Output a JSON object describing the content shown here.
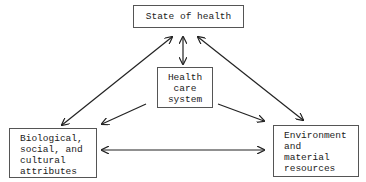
{
  "nodes": {
    "state": {
      "lines": [
        "State of health"
      ]
    },
    "care": {
      "lines": [
        "Health",
        "care",
        "system"
      ]
    },
    "bio": {
      "lines": [
        "Biological,",
        "social, and",
        "cultural",
        "attributes"
      ]
    },
    "env": {
      "lines": [
        "Environment",
        "and",
        "material",
        "resources"
      ]
    }
  },
  "edges": [
    {
      "from": "bio",
      "to": "state",
      "type": "bidirectional"
    },
    {
      "from": "env",
      "to": "state",
      "type": "bidirectional"
    },
    {
      "from": "care",
      "to": "state",
      "type": "bidirectional"
    },
    {
      "from": "care",
      "to": "bio",
      "type": "directed"
    },
    {
      "from": "care",
      "to": "env",
      "type": "directed"
    },
    {
      "from": "bio",
      "to": "env",
      "type": "bidirectional"
    }
  ]
}
